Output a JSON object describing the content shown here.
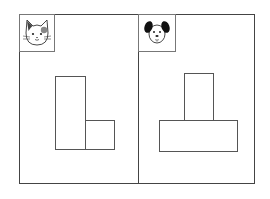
{
  "panels": [
    {
      "id": "left",
      "icon": "cat-face-icon",
      "shape": "L-shape",
      "rects": [
        {
          "x": 55,
          "y": 76,
          "w": 31,
          "h": 74
        },
        {
          "x": 85,
          "y": 120,
          "w": 30,
          "h": 30
        }
      ]
    },
    {
      "id": "right",
      "icon": "dog-face-icon",
      "shape": "T-shape",
      "rects": [
        {
          "x": 184,
          "y": 73,
          "w": 30,
          "h": 48
        },
        {
          "x": 159,
          "y": 120,
          "w": 79,
          "h": 32
        }
      ]
    }
  ],
  "colors": {
    "line": "#555555",
    "background": "#ffffff"
  }
}
